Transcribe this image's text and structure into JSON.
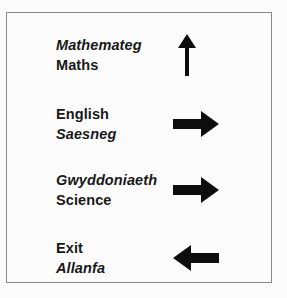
{
  "sign": {
    "board_name": "bilingual-direction-sign",
    "border_color": "#8a8a8a",
    "background_color": "#fcfcfc",
    "text_color": "#181818",
    "rows": [
      {
        "welsh": "Mathemateg",
        "english": "Maths",
        "welsh_first": true,
        "arrow": "arrow-up",
        "arrow_direction": "up"
      },
      {
        "welsh": "Saesneg",
        "english": "English",
        "welsh_first": false,
        "arrow": "arrow-right",
        "arrow_direction": "right"
      },
      {
        "welsh": "Gwyddoniaeth",
        "english": "Science",
        "welsh_first": true,
        "arrow": "arrow-right",
        "arrow_direction": "right"
      },
      {
        "welsh": "Allanfa",
        "english": "Exit",
        "welsh_first": false,
        "arrow": "arrow-left",
        "arrow_direction": "left"
      }
    ]
  },
  "lines": {
    "r1l1": "Mathemateg",
    "r1l2": "Maths",
    "r2l1": "English",
    "r2l2": "Saesneg",
    "r3l1": "Gwyddoniaeth",
    "r3l2": "Science",
    "r4l1": "Exit",
    "r4l2": "Allanfa"
  }
}
